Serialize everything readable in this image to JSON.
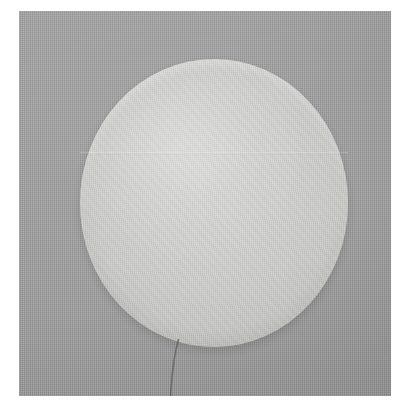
{
  "image": {
    "kind": "photograph",
    "subject": "round white cotton pad disc with thin trailing thread",
    "background_description": "flat gray woven fabric surface",
    "alt_text": "A round off-white cotton pad lying on a gray woven fabric background, with a thin dark thread trailing from its lower-left edge toward the bottom of the frame.",
    "canvas": {
      "width_px": 411,
      "height_px": 416,
      "margin_color": "#ffffff"
    },
    "photo_area": {
      "left_px": 19,
      "top_px": 11,
      "width_px": 372,
      "height_px": 385
    },
    "colors": {
      "page_margin": "#ffffff",
      "fabric_background": "#9b9b9b",
      "disc_body": "#d0d0cd",
      "disc_edge_shadow": "#b9b9b6",
      "thread": "#5e5e5c"
    },
    "objects": [
      {
        "name": "cotton-pad-disc",
        "shape": "circle",
        "center_x_px": 195,
        "center_y_px": 203,
        "width_px": 268,
        "height_px": 288,
        "fill": "#d0d0cd"
      },
      {
        "name": "horizontal-seam",
        "shape": "line",
        "y_px": 142,
        "description": "faint horizontal fold line across the upper third of the disc"
      },
      {
        "name": "thread",
        "shape": "line",
        "start_x_px": 159,
        "start_y_px": 330,
        "end_x_px": 151,
        "end_y_px": 396,
        "color": "#5e5e5c"
      }
    ]
  }
}
